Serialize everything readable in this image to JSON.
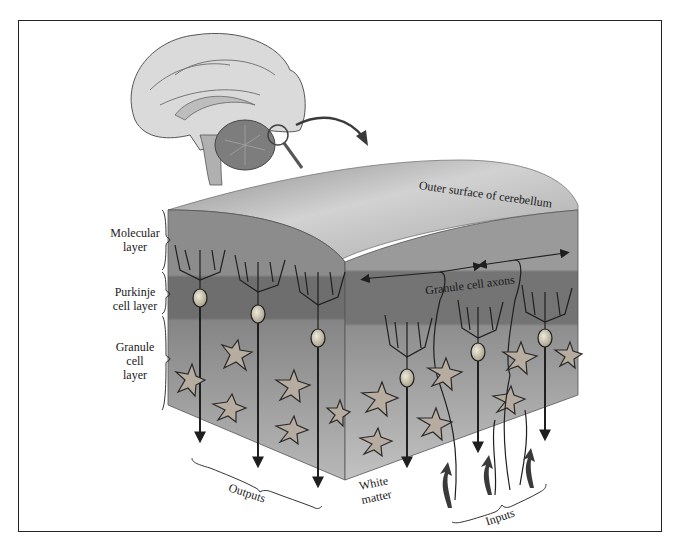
{
  "figure": {
    "labels": {
      "outer_surface": "Outer surface of cerebellum",
      "granule_axons": "Granule cell axons",
      "molecular_layer": [
        "Molecular",
        "layer"
      ],
      "purkinje_layer": [
        "Purkinje",
        "cell layer"
      ],
      "granule_layer": [
        "Granule",
        "cell",
        "layer"
      ],
      "outputs": "Outputs",
      "white_matter": [
        "White",
        "matter"
      ],
      "inputs": "Inputs"
    },
    "colors": {
      "background": "#ffffff",
      "border": "#222222",
      "top_surface_light": "#d9d9d9",
      "top_surface_dark": "#9a9a9a",
      "molecular": "#8f8f8f",
      "purkinje": "#6f6f6f",
      "granule": "#8a8a8a",
      "white_matter": "#b5b5b5",
      "brain": "#d6d6d6",
      "cerebellum": "#7d7d7d",
      "neuron_line": "#1f1f1f",
      "cell_body": "#d8d2bf"
    },
    "icons": [
      "brain-sagittal-illustration",
      "magnifier-icon",
      "curved-arrow-icon",
      "output-arrow-icon",
      "input-arrow-icon"
    ]
  }
}
